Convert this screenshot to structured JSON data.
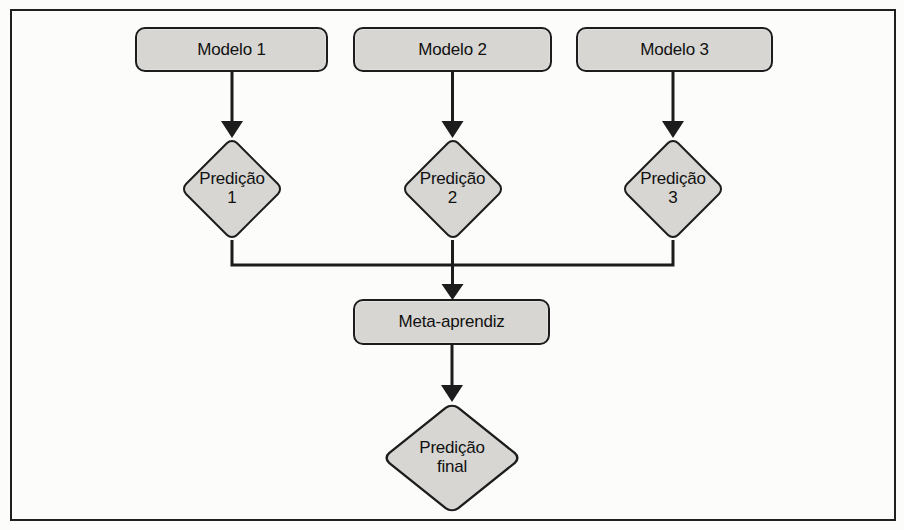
{
  "figure": {
    "background_color": "#fcfcfa",
    "frame_color": "#1f1f1f",
    "node_fill_color": "#d7d6d2",
    "node_border_color": "#1c1c1c",
    "connector_color": "#1c1c1c",
    "nodes": {
      "model1": {
        "label": "Modelo 1"
      },
      "model2": {
        "label": "Modelo 2"
      },
      "model3": {
        "label": "Modelo 3"
      },
      "prediction1": {
        "line1": "Predição",
        "line2": "1"
      },
      "prediction2": {
        "line1": "Predição",
        "line2": "2"
      },
      "prediction3": {
        "line1": "Predição",
        "line2": "3"
      },
      "meta_learner": {
        "label": "Meta-aprendiz"
      },
      "final_prediction": {
        "line1": "Predição",
        "line2": "final"
      }
    }
  }
}
